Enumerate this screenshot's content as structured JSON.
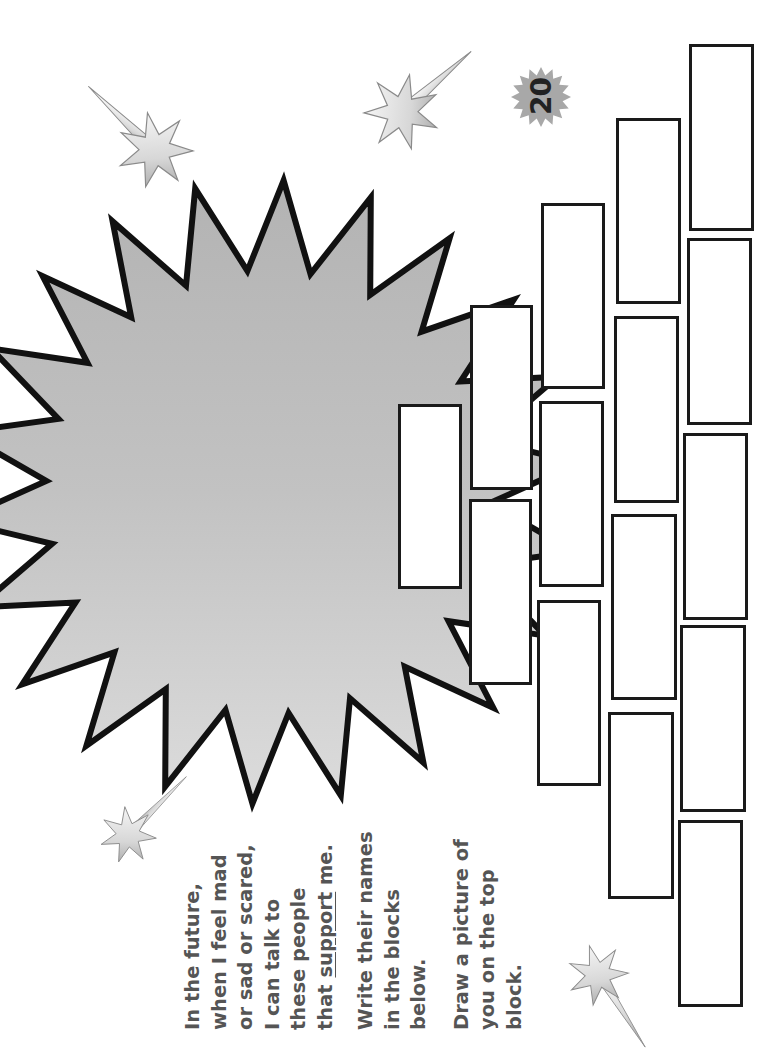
{
  "page": {
    "page_number": "20",
    "accent_colors": {
      "burst_fill": "#bdbdbd",
      "outline": "#111111",
      "text": "#555555",
      "badge": "#a8a8a8"
    }
  },
  "instructions": {
    "paragraph1_lines_before": "In the future,\nwhen I feel mad\nor sad or scared,\nI can talk to\nthese people\nthat ",
    "paragraph1_underlined": "support",
    "paragraph1_after": " me.",
    "paragraph2": "Write their names\nin the blocks\nbelow.",
    "paragraph3": "Draw a picture of\nyou on the top\nblock."
  },
  "decorations": {
    "icons": [
      "shooting-star-icon",
      "shooting-star-icon",
      "shooting-star-icon",
      "shooting-star-icon",
      "starburst-icon",
      "page-badge-icon"
    ]
  },
  "blocks": {
    "rows": [
      {
        "name": "top-block",
        "count": 1,
        "purpose": "drawing"
      },
      {
        "name": "row-2",
        "count": 2
      },
      {
        "name": "row-3",
        "count": 3
      },
      {
        "name": "row-4",
        "count": 4
      },
      {
        "name": "row-5",
        "count": 5
      }
    ],
    "names": [
      "",
      "",
      "",
      "",
      "",
      "",
      "",
      "",
      "",
      "",
      "",
      "",
      "",
      "",
      ""
    ]
  }
}
